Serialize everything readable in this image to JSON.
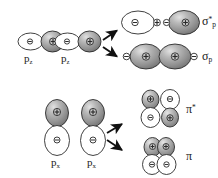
{
  "diagram": {
    "colors": {
      "outline": "#2b2b2b",
      "lobe_positive_fill": "#8c8c8c",
      "lobe_positive_highlight": "#d8d8d8",
      "lobe_negative_fill": "#ffffff",
      "text": "#1a1a1a",
      "arrow": "#111111"
    },
    "signs": {
      "plus": "+",
      "minus": "-"
    },
    "rows": [
      {
        "id": "sigma-row",
        "reactants": [
          {
            "id": "pz-left",
            "label_base": "p",
            "label_sub": "z",
            "lobes": [
              {
                "sign": "-",
                "shade": "white",
                "position": "left"
              },
              {
                "sign": "+",
                "shade": "gray",
                "position": "right"
              }
            ]
          },
          {
            "id": "pz-right",
            "label_base": "p",
            "label_sub": "z",
            "lobes": [
              {
                "sign": "-",
                "shade": "white",
                "position": "left"
              },
              {
                "sign": "+",
                "shade": "gray",
                "position": "right"
              }
            ]
          }
        ],
        "products": [
          {
            "id": "sigma-star-p",
            "label_base": "σ",
            "label_sup": "*",
            "label_sub": "p",
            "type": "antibonding",
            "lobes": [
              {
                "sign": "-",
                "shade": "white",
                "size": "large"
              },
              {
                "sign": "+",
                "shade": "white",
                "size": "small"
              },
              {
                "sign": "-",
                "shade": "white",
                "size": "small"
              },
              {
                "sign": "+",
                "shade": "gray",
                "size": "large"
              }
            ]
          },
          {
            "id": "sigma-p",
            "label_base": "σ",
            "label_sub": "p",
            "type": "bonding",
            "lobes": [
              {
                "sign": "-",
                "shade": "white",
                "size": "small"
              },
              {
                "sign": "+",
                "shade": "gray",
                "size": "large"
              },
              {
                "sign": "+",
                "shade": "gray",
                "size": "large"
              },
              {
                "sign": "-",
                "shade": "white",
                "size": "small"
              }
            ]
          }
        ]
      },
      {
        "id": "pi-row",
        "reactants": [
          {
            "id": "px-left",
            "label_base": "p",
            "label_sub": "x",
            "lobes": [
              {
                "sign": "+",
                "shade": "gray",
                "position": "top"
              },
              {
                "sign": "-",
                "shade": "white",
                "position": "bottom"
              }
            ]
          },
          {
            "id": "px-right",
            "label_base": "p",
            "label_sub": "x",
            "lobes": [
              {
                "sign": "+",
                "shade": "gray",
                "position": "top"
              },
              {
                "sign": "-",
                "shade": "white",
                "position": "bottom"
              }
            ]
          }
        ],
        "products": [
          {
            "id": "pi-star",
            "label_base": "π",
            "label_sup": "*",
            "type": "antibonding",
            "lobes": [
              {
                "sign": "+",
                "shade": "gray",
                "position": "top-left"
              },
              {
                "sign": "-",
                "shade": "white",
                "position": "bottom-left"
              },
              {
                "sign": "-",
                "shade": "white",
                "position": "top-right"
              },
              {
                "sign": "+",
                "shade": "gray",
                "position": "bottom-right"
              }
            ]
          },
          {
            "id": "pi",
            "label_base": "π",
            "type": "bonding",
            "lobes": [
              {
                "sign": "+",
                "shade": "gray",
                "position": "top-left"
              },
              {
                "sign": "+",
                "shade": "gray",
                "position": "top-right"
              },
              {
                "sign": "-",
                "shade": "white",
                "position": "bottom-left"
              },
              {
                "sign": "-",
                "shade": "white",
                "position": "bottom-right"
              }
            ]
          }
        ],
        "arrows": 2
      }
    ],
    "labels": {
      "pz_left": {
        "base": "p",
        "sub": "z"
      },
      "pz_right": {
        "base": "p",
        "sub": "z"
      },
      "px_left": {
        "base": "p",
        "sub": "x"
      },
      "px_right": {
        "base": "p",
        "sub": "x"
      },
      "sigma_star": {
        "base": "σ",
        "sup": "*",
        "sub": "p"
      },
      "sigma": {
        "base": "σ",
        "sub": "p"
      },
      "pi_star": {
        "base": "π",
        "sup": "*"
      },
      "pi": {
        "base": "π"
      }
    }
  }
}
